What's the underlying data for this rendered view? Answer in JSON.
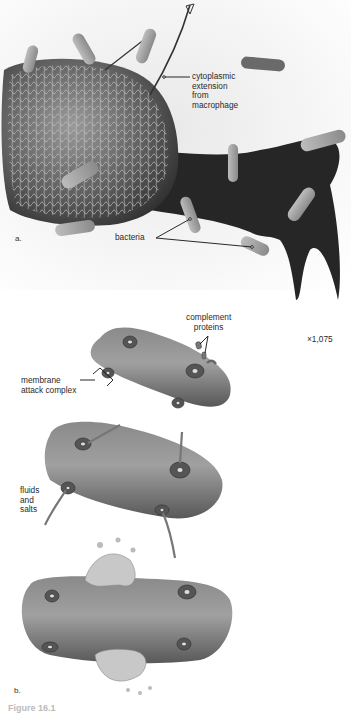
{
  "figure": {
    "panel_a": {
      "letter": "a.",
      "labels": {
        "cytoplasmic": [
          "cytoplasmic",
          "extension",
          "from",
          "macrophage"
        ],
        "bacteria": "bacteria",
        "magnification": "×1,075"
      }
    },
    "panel_b": {
      "letter": "b.",
      "labels": {
        "complement": [
          "complement",
          "proteins"
        ],
        "mac": [
          "membrane",
          "attack complex"
        ],
        "fluids": [
          "fluids",
          "and",
          "salts"
        ]
      }
    },
    "caption_partial": "Figure 16.1"
  },
  "colors": {
    "background": "#ffffff",
    "cell_dark": "#2a2a2a",
    "cell_mid": "#6e6e6e",
    "bacterium_sem": "#a8a8a8",
    "bacterium_drawn": "#7a7a7a",
    "label_text": "#2a2a2a"
  }
}
